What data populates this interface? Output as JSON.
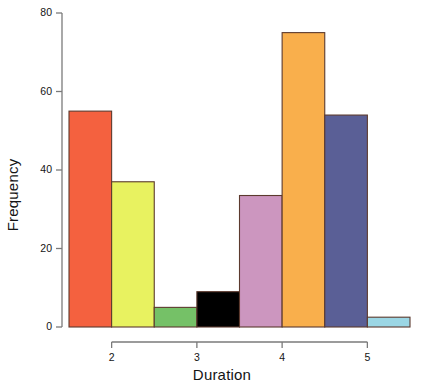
{
  "chart_data": {
    "type": "bar",
    "title": "",
    "xlabel": "Duration",
    "ylabel": "Frequency",
    "categories": [
      "1.5-2.0",
      "2.0-2.5",
      "2.5-3.0",
      "3.0-3.5",
      "3.5-4.0",
      "4.0-4.5",
      "4.5-5.0",
      "5.0-5.5"
    ],
    "bin_edges": [
      1.5,
      2.0,
      2.5,
      3.0,
      3.5,
      4.0,
      4.5,
      5.0,
      5.5
    ],
    "values": [
      55,
      37,
      5,
      9,
      33.5,
      75,
      54,
      2.5
    ],
    "bar_colors": [
      "#F4613F",
      "#E8F260",
      "#75C167",
      "#000000",
      "#CC96BF",
      "#F9AF4C",
      "#5A5F96",
      "#9BD6E4"
    ],
    "bar_border_color": "#5C3A2E",
    "xlim": [
      1.5,
      5.5
    ],
    "ylim": [
      0,
      80
    ],
    "xticks": [
      2,
      3,
      4,
      5
    ],
    "xtick_labels": [
      "2",
      "3",
      "4",
      "5"
    ],
    "yticks": [
      0,
      20,
      40,
      60,
      80
    ],
    "ytick_labels": [
      "0",
      "20",
      "40",
      "60",
      "80"
    ],
    "grid": false,
    "legend": false,
    "axis_color": "#7a7a7a"
  }
}
